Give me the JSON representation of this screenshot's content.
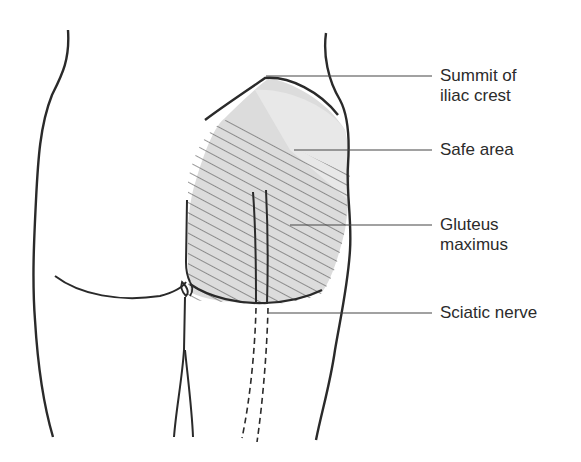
{
  "figure": {
    "labels": [
      {
        "id": "summit",
        "lines": [
          "Summit of",
          "iliac crest"
        ]
      },
      {
        "id": "safe",
        "lines": [
          "Safe area"
        ]
      },
      {
        "id": "gluteus",
        "lines": [
          "Gluteus",
          "maximus"
        ]
      },
      {
        "id": "sciatic",
        "lines": [
          "Sciatic nerve"
        ]
      }
    ],
    "colors": {
      "outline": "#2a2a2a",
      "shade": "#d9d9d9",
      "shade_light": "#e6e6e6",
      "hatch": "#555555",
      "leader": "#444444"
    }
  }
}
